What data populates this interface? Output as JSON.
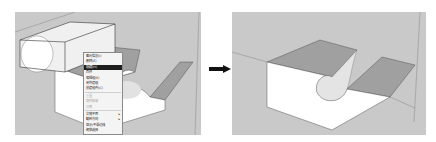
{
  "figure": {
    "before_panel": "sketchup-viewport-before",
    "after_panel": "sketchup-viewport-after",
    "arrow_icon": "right-arrow-icon"
  },
  "context_menu": {
    "items": [
      {
        "label": "图元信息(I)",
        "state": "normal"
      },
      {
        "label": "删除(E)",
        "state": "normal"
      },
      {
        "label": "隐藏(H)",
        "state": "highlighted"
      },
      {
        "label": "炸开",
        "state": "normal"
      },
      {
        "label": "编辑组(E)",
        "state": "normal"
      },
      {
        "label": "另外建组",
        "state": "normal"
      },
      {
        "label": "创建组件(C)",
        "state": "normal"
      },
      {
        "label": "重置",
        "state": "disabled"
      },
      {
        "label": "解除黏接",
        "state": "disabled"
      },
      {
        "label": "分离",
        "state": "disabled"
      },
      {
        "label": "交错平面",
        "state": "normal",
        "submenu": "▸"
      },
      {
        "label": "翻转方向",
        "state": "normal",
        "submenu": "▸"
      },
      {
        "label": "显示/平滑边线",
        "state": "normal"
      },
      {
        "label": "缩放选择",
        "state": "normal"
      }
    ]
  },
  "colors": {
    "viewport_bg": "#c9c9c9",
    "top_face": "#9a9a9a",
    "side_face": "#ffffff",
    "edge": "#555555",
    "highlight": "#1e1e1e"
  }
}
